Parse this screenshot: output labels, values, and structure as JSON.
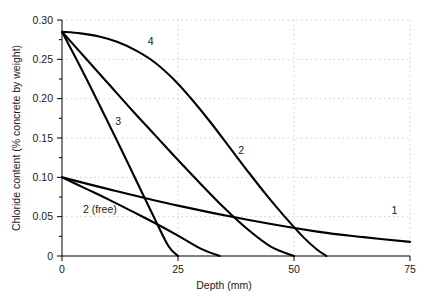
{
  "figure": {
    "top_cropped_caption": "",
    "background": "#ffffff",
    "line_color": "#000000",
    "grid_color": "#bdbdbd"
  },
  "chart_data": {
    "type": "line",
    "title": "",
    "xlabel": "Depth (mm)",
    "ylabel": "Chloride content (% concrete by weight)",
    "xlim": [
      0,
      75
    ],
    "ylim": [
      0,
      0.3
    ],
    "xticks": [
      0,
      25,
      50,
      75
    ],
    "xtick_labels": [
      "0",
      "25",
      "50",
      "75"
    ],
    "yticks": [
      0,
      0.05,
      0.1,
      0.15,
      0.2,
      0.25,
      0.3
    ],
    "ytick_labels": [
      "0",
      "0.05",
      "0.10",
      "0.15",
      "0.20",
      "0.25",
      "0.30"
    ],
    "y_minor_ticks": [
      0.025,
      0.075,
      0.125,
      0.175,
      0.225,
      0.275
    ],
    "grid": "dotted",
    "grid_axis": "y",
    "legend_position": "inline-labels",
    "series": [
      {
        "name": "1",
        "label": "1",
        "label_x": 71.0,
        "label_y": 0.053,
        "x": [
          0,
          10,
          25,
          40,
          55,
          65,
          75
        ],
        "y": [
          0.1,
          0.085,
          0.064,
          0.046,
          0.031,
          0.024,
          0.018
        ]
      },
      {
        "name": "2",
        "label": "2",
        "label_x": 38.0,
        "label_y": 0.13,
        "x": [
          0,
          5,
          10,
          15,
          20,
          25,
          30,
          35,
          40,
          45,
          50
        ],
        "y": [
          0.285,
          0.252,
          0.219,
          0.186,
          0.154,
          0.122,
          0.091,
          0.061,
          0.034,
          0.012,
          0.0
        ]
      },
      {
        "name": "2 (free)",
        "label": "2 (free)",
        "label_x": 4.5,
        "label_y": 0.055,
        "x": [
          0,
          5,
          10,
          15,
          20,
          25,
          30,
          34
        ],
        "y": [
          0.1,
          0.086,
          0.072,
          0.057,
          0.042,
          0.026,
          0.009,
          0.0
        ]
      },
      {
        "name": "3",
        "label": "3",
        "label_x": 11.5,
        "label_y": 0.166,
        "x": [
          0,
          4,
          8,
          12,
          16,
          20,
          23,
          25
        ],
        "y": [
          0.285,
          0.24,
          0.193,
          0.145,
          0.096,
          0.047,
          0.012,
          0.0
        ]
      },
      {
        "name": "4",
        "label": "4",
        "label_x": 18.5,
        "label_y": 0.268,
        "x": [
          0,
          4,
          8,
          12,
          16,
          20,
          24,
          28,
          32,
          36,
          40,
          44,
          48,
          52,
          55,
          57
        ],
        "y": [
          0.285,
          0.283,
          0.279,
          0.272,
          0.261,
          0.246,
          0.225,
          0.199,
          0.17,
          0.139,
          0.108,
          0.078,
          0.05,
          0.024,
          0.008,
          0.0
        ]
      }
    ]
  }
}
